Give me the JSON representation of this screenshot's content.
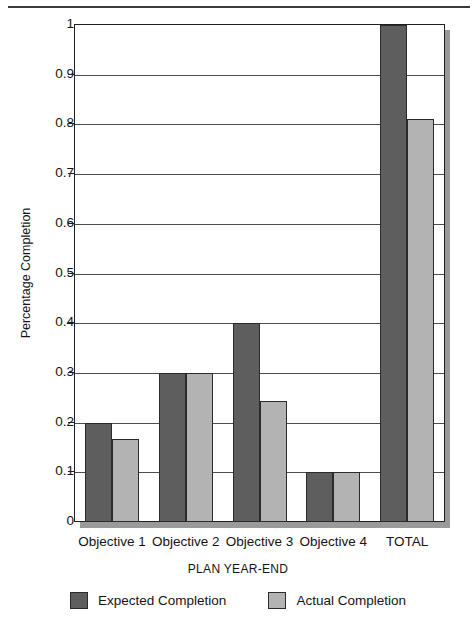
{
  "chart_data": {
    "type": "bar",
    "title": "",
    "xlabel": "PLAN YEAR-END",
    "ylabel": "Percentage Completion",
    "categories": [
      "Objective 1",
      "Objective 2",
      "Objective 3",
      "Objective 4",
      "TOTAL"
    ],
    "series": [
      {
        "name": "Expected Completion",
        "color": "#5e5e5e",
        "values": [
          0.2,
          0.3,
          0.4,
          0.1,
          1.0
        ]
      },
      {
        "name": "Actual Completion",
        "color": "#b3b3b3",
        "values": [
          0.167,
          0.3,
          0.243,
          0.1,
          0.81
        ]
      }
    ],
    "ylim": [
      0,
      1
    ],
    "ytick_values": [
      0,
      0.1,
      0.2,
      0.3,
      0.4,
      0.5,
      0.6,
      0.7,
      0.8,
      0.9,
      1
    ],
    "ytick_labels": [
      "0",
      "0.1",
      "0.2",
      "0.3",
      "0.4",
      "0.5",
      "0.6",
      "0.7",
      "0.8",
      "0.9",
      "1"
    ],
    "grid": "horizontal",
    "legend_position": "bottom-center"
  },
  "legend": {
    "entries": [
      {
        "label": "Expected Completion",
        "swatch": "expected"
      },
      {
        "label": "Actual Completion",
        "swatch": "actual"
      }
    ]
  }
}
